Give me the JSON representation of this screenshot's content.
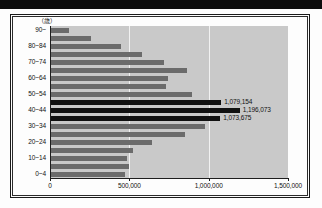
{
  "chart_data": {
    "type": "bar",
    "orientation": "horizontal",
    "title": "",
    "xlabel": "",
    "ylabel": "",
    "unit_x": "（人）",
    "unit_y": "（歳）",
    "xlim": [
      0,
      1500000
    ],
    "xticks": [
      0,
      500000,
      1000000,
      1500000
    ],
    "xtick_labels": [
      "0",
      "500,000",
      "1,000,000",
      "1,500,000"
    ],
    "grid": true,
    "grid_axis": "x",
    "legend": "none",
    "bar_color": "#6b6b6b",
    "highlight_color": "#111111",
    "plot_background": "#c9c9c9",
    "categories": [
      "90~",
      "85~89",
      "80~84",
      "75~79",
      "70~74",
      "65~69",
      "60~64",
      "55~59",
      "50~54",
      "45~49",
      "40~44",
      "35~39",
      "30~34",
      "25~29",
      "20~24",
      "15~19",
      "10~14",
      "5~9",
      "0~4"
    ],
    "visible_tick_labels": [
      "90~",
      "",
      "80~84",
      "",
      "70~74",
      "",
      "60~64",
      "",
      "50~54",
      "",
      "40~44",
      "",
      "30~34",
      "",
      "20~24",
      "",
      "10~14",
      "",
      "0~4"
    ],
    "values": [
      118000,
      258000,
      448000,
      580000,
      718000,
      862000,
      742000,
      730000,
      898000,
      1079154,
      1196073,
      1073675,
      980000,
      848000,
      640000,
      520000,
      488000,
      500000,
      470000
    ],
    "highlighted": [
      false,
      false,
      false,
      false,
      false,
      false,
      false,
      false,
      false,
      true,
      true,
      true,
      false,
      false,
      false,
      false,
      false,
      false,
      false
    ],
    "data_labels": [
      {
        "category": "45~49",
        "value": 1079154,
        "text": "1,079,154"
      },
      {
        "category": "40~44",
        "value": 1196073,
        "text": "1,196,073"
      },
      {
        "category": "35~39",
        "value": 1073675,
        "text": "1,073,675"
      }
    ]
  }
}
